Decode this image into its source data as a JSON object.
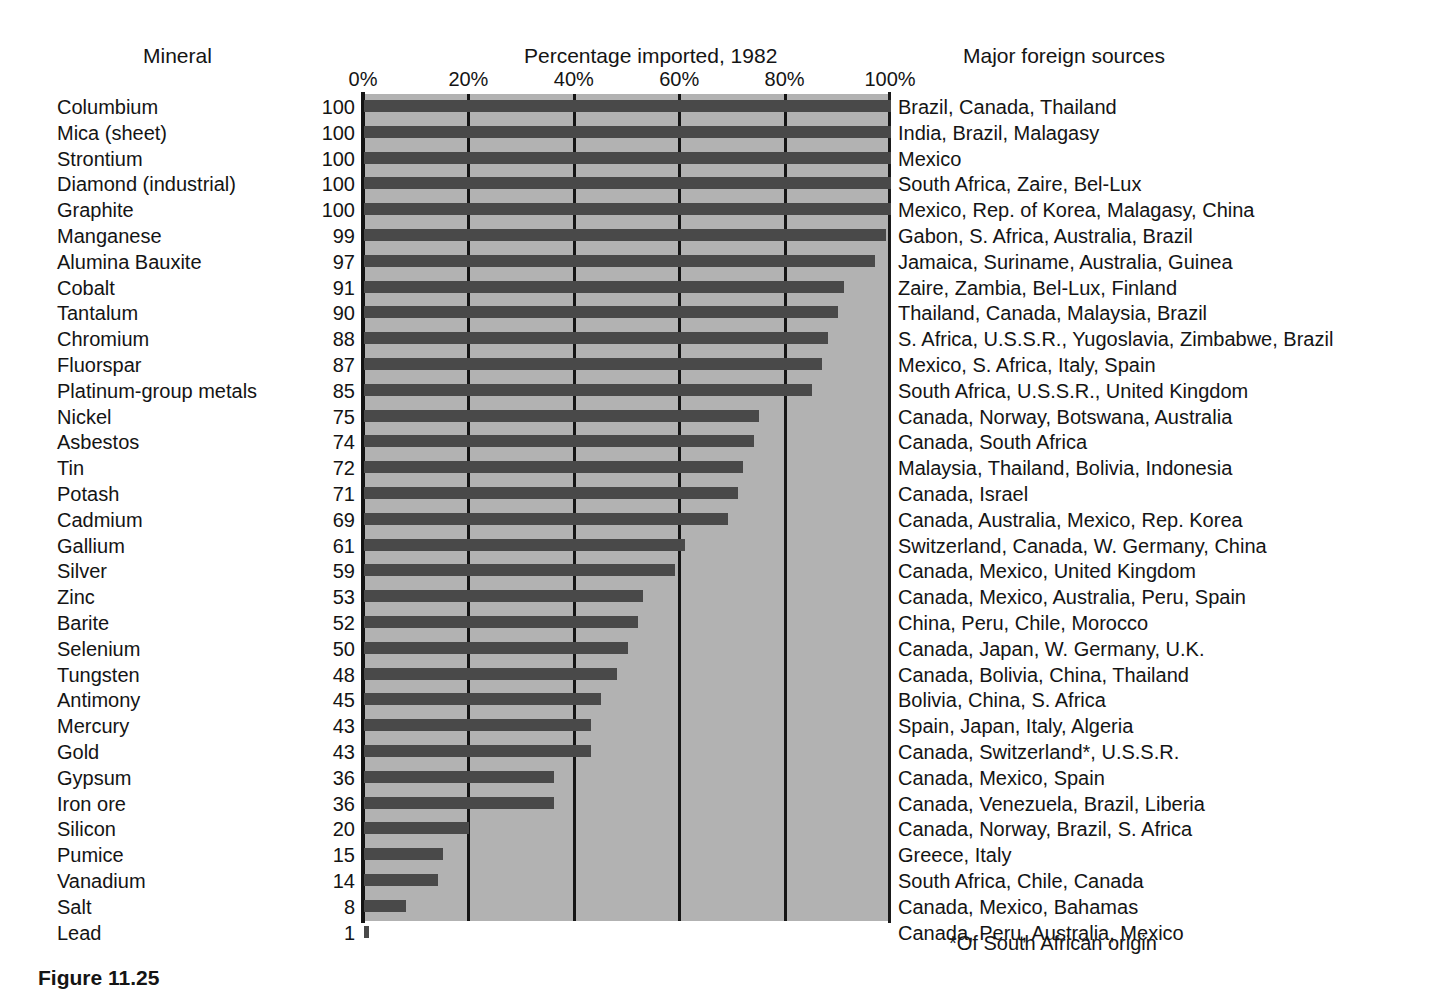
{
  "header": {
    "col_mineral": "Mineral",
    "col_percentage": "Percentage imported, 1982",
    "col_sources": "Major foreign sources"
  },
  "footnote": "*Of South African origin",
  "caption": "Figure 11.25",
  "colors": {
    "plot_background": "#b2b2b2",
    "bar": "#494949",
    "gridline": "#151515",
    "text": "#141414",
    "page_background": "#ffffff"
  },
  "chart_data": {
    "type": "bar",
    "orientation": "horizontal",
    "title": "Percentage imported, 1982",
    "xlabel": "",
    "ylabel": "Mineral",
    "xlim": [
      0,
      100
    ],
    "xticks": [
      0,
      20,
      40,
      60,
      80,
      100
    ],
    "xtick_labels": [
      "0%",
      "20%",
      "40%",
      "60%",
      "80%",
      "100%"
    ],
    "grid": true,
    "legend": null,
    "categories": [
      "Columbium",
      "Mica (sheet)",
      "Strontium",
      "Diamond (industrial)",
      "Graphite",
      "Manganese",
      "Alumina Bauxite",
      "Cobalt",
      "Tantalum",
      "Chromium",
      "Fluorspar",
      "Platinum-group metals",
      "Nickel",
      "Asbestos",
      "Tin",
      "Potash",
      "Cadmium",
      "Gallium",
      "Silver",
      "Zinc",
      "Barite",
      "Selenium",
      "Tungsten",
      "Antimony",
      "Mercury",
      "Gold",
      "Gypsum",
      "Iron ore",
      "Silicon",
      "Pumice",
      "Vanadium",
      "Salt",
      "Lead"
    ],
    "values": [
      100,
      100,
      100,
      100,
      100,
      99,
      97,
      91,
      90,
      88,
      87,
      85,
      75,
      74,
      72,
      71,
      69,
      61,
      59,
      53,
      52,
      50,
      48,
      45,
      43,
      43,
      36,
      36,
      20,
      15,
      14,
      8,
      1
    ],
    "sources": [
      "Brazil, Canada, Thailand",
      "India, Brazil, Malagasy",
      "Mexico",
      "South Africa, Zaire, Bel-Lux",
      "Mexico, Rep. of Korea, Malagasy, China",
      "Gabon, S. Africa, Australia, Brazil",
      "Jamaica, Suriname, Australia, Guinea",
      "Zaire, Zambia, Bel-Lux, Finland",
      "Thailand, Canada, Malaysia, Brazil",
      "S. Africa, U.S.S.R., Yugoslavia, Zimbabwe, Brazil",
      "Mexico, S. Africa, Italy, Spain",
      "South Africa, U.S.S.R., United Kingdom",
      "Canada, Norway, Botswana, Australia",
      "Canada, South Africa",
      "Malaysia, Thailand, Bolivia, Indonesia",
      "Canada, Israel",
      "Canada, Australia, Mexico, Rep. Korea",
      "Switzerland, Canada, W. Germany, China",
      "Canada, Mexico, United Kingdom",
      "Canada, Mexico, Australia, Peru, Spain",
      "China, Peru, Chile, Morocco",
      "Canada, Japan, W. Germany, U.K.",
      "Canada, Bolivia, China, Thailand",
      "Bolivia, China, S. Africa",
      "Spain, Japan, Italy, Algeria",
      "Canada, Switzerland*, U.S.S.R.",
      "Canada, Mexico, Spain",
      "Canada, Venezuela, Brazil, Liberia",
      "Canada, Norway, Brazil, S. Africa",
      "Greece, Italy",
      "South Africa, Chile, Canada",
      "Canada, Mexico, Bahamas",
      "Canada, Peru, Australia, Mexico"
    ]
  }
}
